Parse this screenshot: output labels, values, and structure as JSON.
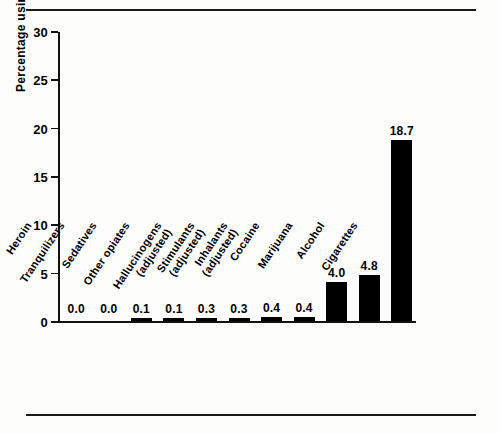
{
  "figure": {
    "top_rule": true,
    "bottom_rule": true
  },
  "chart_data": {
    "type": "bar",
    "title": "",
    "xlabel": "",
    "ylabel": "Percentage using daily",
    "ylim": [
      0,
      30
    ],
    "yticks": [
      0,
      5,
      10,
      15,
      20,
      25,
      30
    ],
    "ytick_labels": [
      "0",
      "5",
      "10",
      "15",
      "20",
      "25",
      "30"
    ],
    "grid": false,
    "legend": null,
    "bar_color": "#000000",
    "categories": [
      "Heroin",
      "Tranquilizers",
      "Sedatives",
      "Other opiates",
      "Hallucinogens (adjusted)",
      "Stimulants (adjusted)",
      "Inhalants (adjusted)",
      "Cocaine",
      "Marijuana",
      "Alcohol",
      "Cigarettes"
    ],
    "category_lines": [
      [
        "Heroin"
      ],
      [
        "Tranquilizers"
      ],
      [
        "Sedatives"
      ],
      [
        "Other opiates"
      ],
      [
        "Hallucinogens",
        "(adjusted)"
      ],
      [
        "Stimulants",
        "(adjusted)"
      ],
      [
        "Inhalants",
        "(adjusted)"
      ],
      [
        "Cocaine"
      ],
      [
        "Marijuana"
      ],
      [
        "Alcohol"
      ],
      [
        "Cigarettes"
      ]
    ],
    "values": [
      0.0,
      0.0,
      0.1,
      0.1,
      0.3,
      0.3,
      0.4,
      0.4,
      4.0,
      4.8,
      18.7
    ],
    "data_labels": [
      "0.0",
      "0.0",
      "0.1",
      "0.1",
      "0.3",
      "0.3",
      "0.4",
      "0.4",
      "4.0",
      "4.8",
      "18.7"
    ]
  }
}
